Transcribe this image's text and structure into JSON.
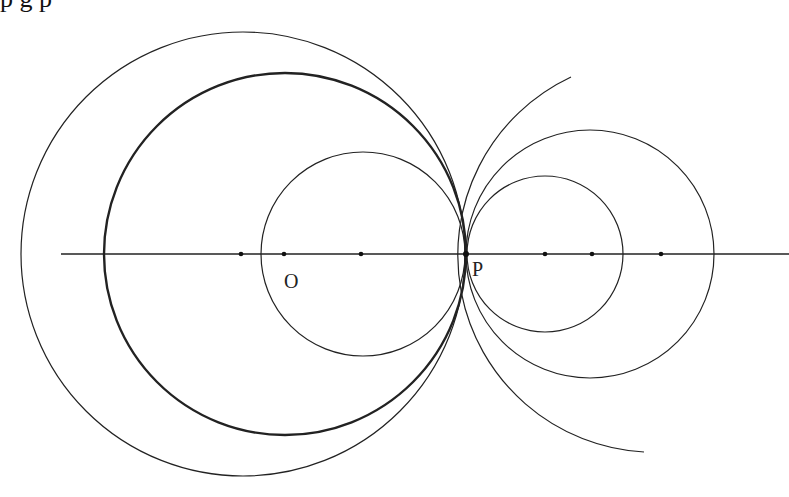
{
  "diagram": {
    "type": "coaxial-circles-tangent-at-point",
    "background": "#ffffff",
    "stroke_color": "#222222",
    "axis_line": {
      "x1": 61,
      "x2": 789,
      "y": 254
    },
    "labels": {
      "O": {
        "text": "O",
        "x": 284,
        "y": 288
      },
      "P": {
        "text": "P",
        "x": 472,
        "y": 276
      }
    },
    "points": [
      {
        "name": "point-left-1",
        "x": 241,
        "y": 254
      },
      {
        "name": "point-O",
        "x": 284,
        "y": 254
      },
      {
        "name": "point-left-3",
        "x": 361,
        "y": 254
      },
      {
        "name": "point-P",
        "x": 466,
        "y": 254
      },
      {
        "name": "point-right-1",
        "x": 545,
        "y": 254
      },
      {
        "name": "point-right-2",
        "x": 592,
        "y": 254
      },
      {
        "name": "point-right-3",
        "x": 661,
        "y": 254
      }
    ],
    "circles": [
      {
        "name": "outer-left-circle",
        "cx": 243,
        "cy": 254,
        "r": 222,
        "width": 1.2
      },
      {
        "name": "thick-left-circle",
        "cx": 285,
        "cy": 254,
        "r": 181,
        "width": 2.4
      },
      {
        "name": "small-left-circle",
        "cx": 363,
        "cy": 254,
        "r": 102,
        "width": 1.2
      },
      {
        "name": "small-right-circle",
        "cx": 545,
        "cy": 254,
        "r": 78,
        "width": 1.2
      },
      {
        "name": "large-right-circle",
        "cx": 590,
        "cy": 254,
        "r": 124,
        "width": 1.2
      }
    ],
    "open_arc": {
      "name": "large-right-open-arc",
      "cx": 663,
      "cy": 254,
      "r": 197,
      "start": [
        571,
        77
      ],
      "end": [
        644,
        452
      ],
      "width": 1.2
    }
  },
  "cropped_header_text": "p    g                                                                        p"
}
